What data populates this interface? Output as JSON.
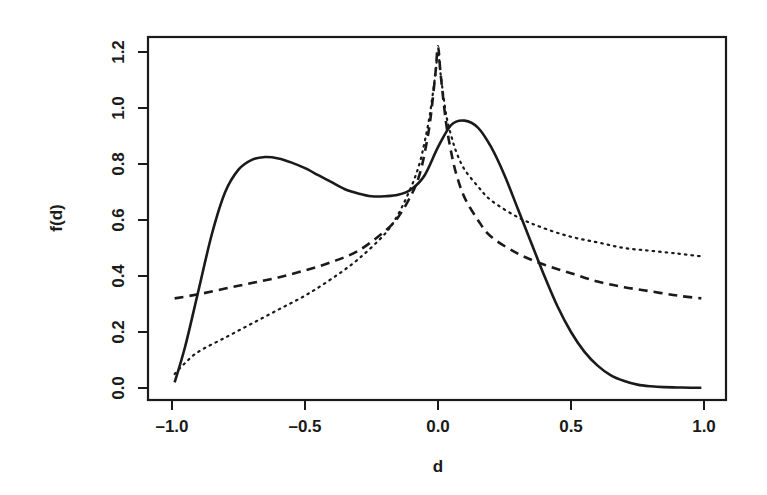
{
  "chart_data": {
    "type": "line",
    "title": "",
    "xlabel": "d",
    "ylabel": "f(d)",
    "xlim": [
      -1.0,
      1.0
    ],
    "ylim": [
      0.0,
      1.25
    ],
    "grid": false,
    "legend": null,
    "x_ticks": [
      "-1.0",
      "-0.5",
      "0.0",
      "0.5",
      "1.0"
    ],
    "y_ticks": [
      "0.0",
      "0.2",
      "0.4",
      "0.6",
      "0.8",
      "1.0",
      "1.2"
    ],
    "series": [
      {
        "name": "solid",
        "style": "solid",
        "x": [
          -0.99,
          -0.95,
          -0.9,
          -0.85,
          -0.8,
          -0.75,
          -0.7,
          -0.65,
          -0.6,
          -0.55,
          -0.5,
          -0.45,
          -0.4,
          -0.35,
          -0.3,
          -0.25,
          -0.2,
          -0.15,
          -0.1,
          -0.05,
          0.0,
          0.05,
          0.1,
          0.15,
          0.2,
          0.25,
          0.3,
          0.35,
          0.4,
          0.45,
          0.5,
          0.55,
          0.6,
          0.65,
          0.7,
          0.75,
          0.8,
          0.85,
          0.9,
          0.95,
          0.99
        ],
        "y": [
          0.02,
          0.15,
          0.35,
          0.55,
          0.7,
          0.78,
          0.815,
          0.825,
          0.82,
          0.805,
          0.785,
          0.76,
          0.735,
          0.71,
          0.695,
          0.685,
          0.685,
          0.69,
          0.71,
          0.76,
          0.86,
          0.94,
          0.955,
          0.93,
          0.86,
          0.76,
          0.64,
          0.52,
          0.4,
          0.29,
          0.2,
          0.13,
          0.08,
          0.045,
          0.025,
          0.012,
          0.006,
          0.003,
          0.002,
          0.001,
          0.001
        ]
      },
      {
        "name": "dashed",
        "style": "dashed",
        "x": [
          -0.99,
          -0.9,
          -0.8,
          -0.7,
          -0.6,
          -0.5,
          -0.4,
          -0.3,
          -0.2,
          -0.15,
          -0.1,
          -0.07,
          -0.05,
          -0.03,
          -0.01,
          0.0,
          0.01,
          0.03,
          0.05,
          0.07,
          0.1,
          0.15,
          0.2,
          0.3,
          0.4,
          0.5,
          0.6,
          0.7,
          0.8,
          0.9,
          0.99
        ],
        "y": [
          0.32,
          0.335,
          0.355,
          0.375,
          0.395,
          0.42,
          0.45,
          0.49,
          0.56,
          0.61,
          0.69,
          0.76,
          0.84,
          0.95,
          1.12,
          1.22,
          1.12,
          0.95,
          0.84,
          0.76,
          0.68,
          0.6,
          0.54,
          0.48,
          0.44,
          0.41,
          0.38,
          0.36,
          0.345,
          0.33,
          0.32
        ]
      },
      {
        "name": "dotted",
        "style": "dotted",
        "x": [
          -0.99,
          -0.95,
          -0.9,
          -0.8,
          -0.7,
          -0.6,
          -0.5,
          -0.4,
          -0.3,
          -0.2,
          -0.15,
          -0.1,
          -0.07,
          -0.05,
          -0.03,
          -0.01,
          0.0,
          0.01,
          0.03,
          0.05,
          0.07,
          0.1,
          0.15,
          0.2,
          0.3,
          0.4,
          0.5,
          0.6,
          0.7,
          0.8,
          0.9,
          0.99
        ],
        "y": [
          0.05,
          0.09,
          0.13,
          0.18,
          0.23,
          0.28,
          0.33,
          0.39,
          0.46,
          0.55,
          0.62,
          0.72,
          0.8,
          0.88,
          0.98,
          1.12,
          1.2,
          1.12,
          0.98,
          0.9,
          0.84,
          0.78,
          0.72,
          0.67,
          0.61,
          0.57,
          0.54,
          0.52,
          0.5,
          0.49,
          0.48,
          0.47
        ]
      }
    ]
  }
}
